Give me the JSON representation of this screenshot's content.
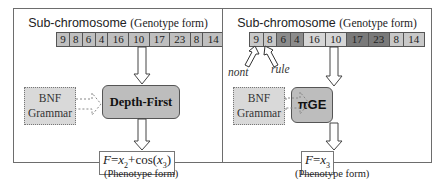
{
  "left": {
    "title_main": "Sub-chromosome",
    "title_sub": "(Genotype form)",
    "codons": [
      {
        "value": "9",
        "color": "#bfbfbf"
      },
      {
        "value": "8",
        "color": "#bfbfbf"
      },
      {
        "value": "6",
        "color": "#bfbfbf"
      },
      {
        "value": "4",
        "color": "#bfbfbf"
      },
      {
        "value": "16",
        "color": "#bfbfbf"
      },
      {
        "value": "10",
        "color": "#bfbfbf"
      },
      {
        "value": "17",
        "color": "#bfbfbf"
      },
      {
        "value": "23",
        "color": "#bfbfbf"
      },
      {
        "value": "8",
        "color": "#bfbfbf"
      },
      {
        "value": "14",
        "color": "#bfbfbf"
      }
    ],
    "grammar_line1": "BNF",
    "grammar_line2": "Grammar",
    "process_label": "Depth-First",
    "formula_F": "F",
    "formula_eq": "=",
    "formula_x": "x",
    "formula_sub1": "2",
    "formula_plus": "+cos(",
    "formula_sub2": "3",
    "formula_close": ")",
    "phenotype_label": "(Phenotype form)"
  },
  "right": {
    "title_main": "Sub-chromosome",
    "title_sub": "(Genotype form)",
    "codons": [
      {
        "value": "9",
        "color": "#c8c8c8"
      },
      {
        "value": "8",
        "color": "#c8c8c8"
      },
      {
        "value": "6",
        "color": "#8c8c8c"
      },
      {
        "value": "4",
        "color": "#8c8c8c"
      },
      {
        "value": "16",
        "color": "#d6d6d6"
      },
      {
        "value": "10",
        "color": "#d6d6d6"
      },
      {
        "value": "17",
        "color": "#7a7a7a"
      },
      {
        "value": "23",
        "color": "#7a7a7a"
      },
      {
        "value": "8",
        "color": "#c8c8c8"
      },
      {
        "value": "14",
        "color": "#c8c8c8"
      }
    ],
    "nont_label": "nont",
    "rule_label": "rule",
    "grammar_line1": "BNF",
    "grammar_line2": "Grammar",
    "process_label": "πGE",
    "formula_F": "F",
    "formula_eq": "=",
    "formula_x": "x",
    "formula_sub": "3",
    "phenotype_label": "(Phenotype form)"
  }
}
